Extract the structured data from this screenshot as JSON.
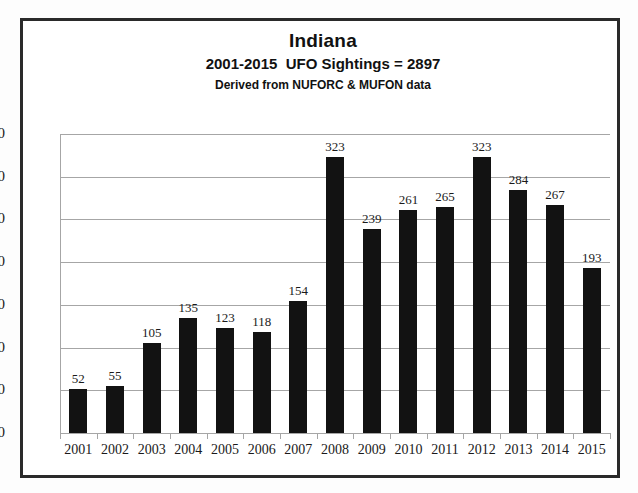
{
  "chart_data": {
    "type": "bar",
    "title": "Indiana",
    "subtitle": "2001-2015  UFO Sightings = 2897",
    "source_note": "Derived from NUFORC & MUFON data",
    "categories": [
      "2001",
      "2002",
      "2003",
      "2004",
      "2005",
      "2006",
      "2007",
      "2008",
      "2009",
      "2010",
      "2011",
      "2012",
      "2013",
      "2014",
      "2015"
    ],
    "values": [
      52,
      55,
      105,
      135,
      123,
      118,
      154,
      323,
      239,
      261,
      265,
      323,
      284,
      267,
      193
    ],
    "xlabel": "",
    "ylabel": "",
    "ylim": [
      0,
      350
    ],
    "ytick_step": 50,
    "yticks": [
      "350",
      "300",
      "250",
      "200",
      "150",
      "100",
      "50",
      "0"
    ],
    "grid": true,
    "legend": false,
    "data_labels": true,
    "total": 2897,
    "colors": {
      "bar": "#121212",
      "gridline": "#a6a6a6",
      "frame": "#2a2a2a",
      "text": "#1a1a1a",
      "background": "#ffffff"
    }
  }
}
